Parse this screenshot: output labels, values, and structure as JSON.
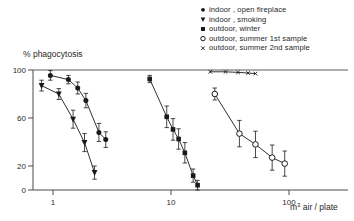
{
  "chart_data": {
    "type": "scatter",
    "title": "",
    "xlabel": "m3 air / plate",
    "xlabel_display": "m³ air / plate",
    "ylabel": "% phagocytosis",
    "xscale": "log",
    "yscale": "linear",
    "xlim": [
      0.55,
      220
    ],
    "ylim": [
      0,
      100
    ],
    "xticks": [
      1,
      10,
      100
    ],
    "xtick_labels": [
      "1",
      "10",
      "100"
    ],
    "yticks": [
      0,
      20,
      60,
      100
    ],
    "ytick_labels": [
      "0",
      "20",
      "60",
      "100"
    ],
    "grid": false,
    "legend_position": "top-right",
    "series": [
      {
        "name": "indoor , open fireplace",
        "marker": "filled-circle",
        "points": [
          {
            "x": 0.95,
            "y": 95.5,
            "err": 4.0
          },
          {
            "x": 1.35,
            "y": 92.0,
            "err": 3.5
          },
          {
            "x": 1.62,
            "y": 85.0,
            "err": 5.0
          },
          {
            "x": 1.9,
            "y": 74.5,
            "err": 6.0
          },
          {
            "x": 2.45,
            "y": 48.0,
            "err": 7.5
          },
          {
            "x": 2.8,
            "y": 42.0,
            "err": 6.5
          }
        ]
      },
      {
        "name": "indoor , smoking",
        "marker": "filled-triangle-down",
        "points": [
          {
            "x": 0.8,
            "y": 87.0,
            "err": 4.5
          },
          {
            "x": 1.12,
            "y": 80.0,
            "err": 4.5
          },
          {
            "x": 1.48,
            "y": 59.0,
            "err": 7.5
          },
          {
            "x": 1.85,
            "y": 39.5,
            "err": 7.5
          },
          {
            "x": 2.25,
            "y": 14.5,
            "err": 5.5
          }
        ]
      },
      {
        "name": "outdoor, winter",
        "marker": "filled-square",
        "points": [
          {
            "x": 6.6,
            "y": 92.5,
            "err": 3.0
          },
          {
            "x": 9.2,
            "y": 61.0,
            "err": 9.0
          },
          {
            "x": 10.4,
            "y": 50.5,
            "err": 9.0
          },
          {
            "x": 11.6,
            "y": 42.5,
            "err": 8.5
          },
          {
            "x": 13.1,
            "y": 31.0,
            "err": 8.5
          },
          {
            "x": 15.4,
            "y": 12.0,
            "err": 5.5
          },
          {
            "x": 16.8,
            "y": 4.0,
            "err": 4.0
          }
        ]
      },
      {
        "name": "outdoor, summer 1st sample",
        "marker": "open-circle",
        "points": [
          {
            "x": 23.5,
            "y": 80.0,
            "err": 5.0
          },
          {
            "x": 38.0,
            "y": 47.0,
            "err": 11.0
          },
          {
            "x": 52.0,
            "y": 38.0,
            "err": 11.0
          },
          {
            "x": 72.0,
            "y": 27.0,
            "err": 10.5
          },
          {
            "x": 92.0,
            "y": 22.0,
            "err": 10.5
          }
        ]
      },
      {
        "name": "outdoor, summer 2nd sample",
        "marker": "small-cross",
        "points": [
          {
            "x": 21.5,
            "y": 98.5,
            "err": 0
          },
          {
            "x": 29.0,
            "y": 98.5,
            "err": 0
          },
          {
            "x": 37.0,
            "y": 98.0,
            "err": 0
          },
          {
            "x": 45.0,
            "y": 97.5,
            "err": 0
          },
          {
            "x": 52.0,
            "y": 97.0,
            "err": 0
          }
        ]
      }
    ],
    "legend": [
      {
        "label": "indoor , open fireplace",
        "marker": "filled-circle"
      },
      {
        "label": "indoor , smoking",
        "marker": "filled-triangle-down"
      },
      {
        "label": "outdoor, winter",
        "marker": "filled-square"
      },
      {
        "label": "outdoor, summer 1st sample",
        "marker": "open-circle"
      },
      {
        "label": "outdoor, summer 2nd sample",
        "marker": "small-cross"
      }
    ],
    "colors": {
      "ink": "#1a1a1a",
      "axis": "#4a4a4a",
      "background": "#ffffff"
    }
  }
}
